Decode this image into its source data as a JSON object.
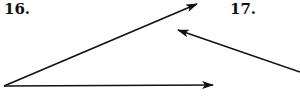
{
  "problems": [
    {
      "label": "16.",
      "figure": "angle",
      "vertex": [
        4,
        86
      ],
      "rays": [
        {
          "name": "upper-ray",
          "end": [
            197,
            4
          ],
          "arrowhead": true
        },
        {
          "name": "lower-ray",
          "end": [
            213,
            85
          ],
          "arrowhead": true
        }
      ]
    },
    {
      "label": "17.",
      "figure": "ray",
      "start": [
        300,
        72
      ],
      "end": [
        178,
        30
      ],
      "arrowhead": true
    }
  ],
  "colors": {
    "stroke": "#111111",
    "background": "#ffffff"
  }
}
